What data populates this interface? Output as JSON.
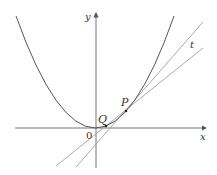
{
  "diagram": {
    "type": "tangent-secant-parabola",
    "labels": {
      "y_axis": "y",
      "x_axis": "x",
      "origin": "0",
      "point_q": "Q",
      "point_p": "P",
      "tangent": "t"
    },
    "colors": {
      "curve": "#555555",
      "axes": "#666666",
      "lines": "#999999",
      "points": "#222222",
      "text": "#333333"
    }
  }
}
